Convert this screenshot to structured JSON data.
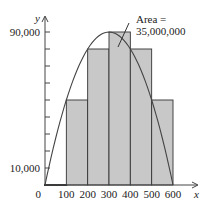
{
  "chart_data": {
    "type": "bar",
    "title": "",
    "xlabel": "x",
    "ylabel": "y",
    "x_ticks": [
      "0",
      "100",
      "200",
      "300",
      "400",
      "500",
      "600"
    ],
    "y_tick_labels": [
      "10,000",
      "90,000"
    ],
    "y_tick_values": [
      10000,
      20000,
      30000,
      40000,
      50000,
      60000,
      70000,
      80000,
      90000
    ],
    "xlim": [
      0,
      600
    ],
    "ylim": [
      0,
      90000
    ],
    "categories": [
      "0-100",
      "100-200",
      "200-300",
      "300-400",
      "400-500",
      "500-600"
    ],
    "values": [
      0,
      50000,
      80000,
      90000,
      80000,
      50000
    ],
    "curve": {
      "type": "line",
      "equation": "y = x(600 - x)",
      "x": [
        0,
        100,
        200,
        300,
        400,
        500,
        600
      ],
      "y": [
        0,
        50000,
        80000,
        90000,
        80000,
        50000,
        0
      ]
    },
    "annotation": {
      "line1": "Area =",
      "line2": "35,000,000"
    },
    "grid": false,
    "legend": null,
    "colors": {
      "bar_fill": "#c8c8c8",
      "stroke": "#333333"
    }
  }
}
